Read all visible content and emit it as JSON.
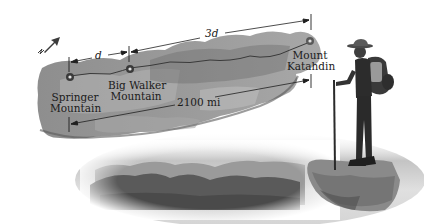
{
  "figure": {
    "compass": {
      "icon": "north-arrow-icon",
      "label": "N"
    },
    "labels": {
      "springer": {
        "line1": "Springer",
        "line2": "Mountain"
      },
      "big_walker": {
        "line1": "Big Walker",
        "line2": "Mountain"
      },
      "katahdin": {
        "line1": "Mount",
        "line2": "Katahdin"
      }
    },
    "dimensions": {
      "short_segment": "d",
      "long_segment": "3d",
      "total_distance": "2100 mi"
    },
    "colors": {
      "map_fill": "#8c8c8c",
      "map_light": "#b4b4b4",
      "map_dark": "#5e5e5e",
      "trail_line": "#3a3a3a",
      "dimension_line": "#1f1f1f",
      "mountain_far": "#9a9a9a",
      "mountain_near": "#5a5a5a",
      "sky": "#d6d6d6",
      "rock": "#8a8a8a",
      "hiker": "#2c2c2c",
      "compass_arrow": "#3c3c3c"
    }
  }
}
